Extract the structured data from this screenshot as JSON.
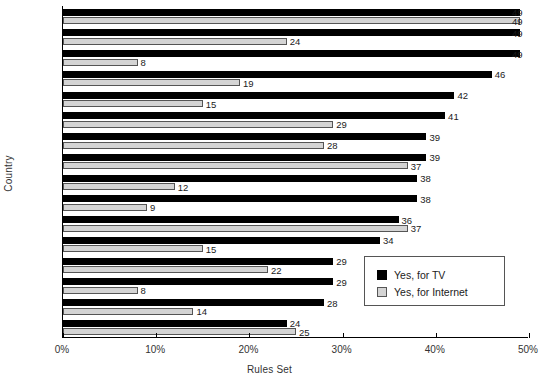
{
  "chart_data": {
    "type": "bar",
    "orientation": "horizontal",
    "title": "",
    "xlabel": "Rules Set",
    "ylabel": "Country",
    "xlim": [
      0,
      50
    ],
    "xunit": "%",
    "grid": false,
    "legend_position": "inner-right",
    "xticks": [
      "0%",
      "10%",
      "20%",
      "30%",
      "40%",
      "50%"
    ],
    "xtick_values": [
      0,
      10,
      20,
      30,
      40,
      50
    ],
    "categories": [
      "DE",
      "FR",
      "EL",
      "AT",
      "ES",
      "BE",
      "UK",
      "NL",
      "PL",
      "PT",
      "SE",
      "SI",
      "EE",
      "BG",
      "CZ",
      "DK"
    ],
    "series": [
      {
        "name": "Yes, for TV",
        "color": "#000000",
        "values": [
          49,
          49,
          49,
          46,
          42,
          41,
          39,
          39,
          38,
          38,
          36,
          34,
          29,
          29,
          28,
          24
        ]
      },
      {
        "name": "Yes, for Internet",
        "color": "#d4d4d4",
        "values": [
          49,
          24,
          8,
          19,
          15,
          29,
          28,
          37,
          12,
          9,
          37,
          15,
          22,
          8,
          14,
          25
        ]
      }
    ],
    "value_labels": {
      "DE": {
        "tv": "49",
        "net": "49"
      },
      "FR": {
        "tv": "49",
        "net": "24"
      },
      "EL": {
        "tv": "49",
        "net": "8"
      },
      "AT": {
        "tv": "46",
        "net": "19"
      },
      "ES": {
        "tv": "42",
        "net": "15"
      },
      "BE": {
        "tv": "41",
        "net": "29"
      },
      "UK": {
        "tv": "39",
        "net": "28"
      },
      "NL": {
        "tv": "39",
        "net": "37"
      },
      "PL": {
        "tv": "38",
        "net": "12"
      },
      "PT": {
        "tv": "38",
        "net": "9"
      },
      "SE": {
        "tv": "36",
        "net": "37"
      },
      "SI": {
        "tv": "34",
        "net": "15"
      },
      "EE": {
        "tv": "29",
        "net": "22"
      },
      "BG": {
        "tv": "29",
        "net": "8"
      },
      "CZ": {
        "tv": "28",
        "net": "14"
      },
      "DK": {
        "tv": "24",
        "net": "25"
      }
    }
  },
  "legend": {
    "items": [
      {
        "label": "Yes, for TV",
        "color": "#000000"
      },
      {
        "label": "Yes, for Internet",
        "color": "#d4d4d4"
      }
    ]
  }
}
